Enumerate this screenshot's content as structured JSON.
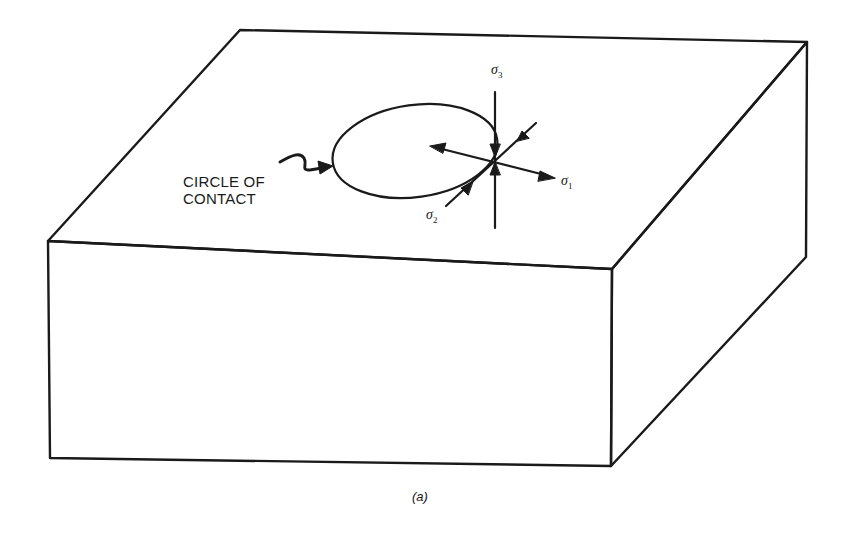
{
  "figure": {
    "caption": "(a)",
    "callout": {
      "line1": "CIRCLE OF",
      "line2": "CONTACT"
    },
    "stress_labels": {
      "sigma1": {
        "symbol": "σ",
        "sub": "1"
      },
      "sigma2": {
        "symbol": "σ",
        "sub": "2"
      },
      "sigma3": {
        "symbol": "σ",
        "sub": "3"
      }
    },
    "colors": {
      "line": "#1a1a1a",
      "background": "#ffffff"
    }
  }
}
